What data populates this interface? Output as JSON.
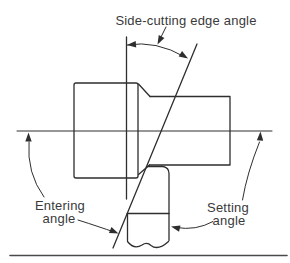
{
  "colors": {
    "ink": "#2e2e2e",
    "text": "#3a3a3a",
    "background": "#ffffff"
  },
  "diagram": {
    "labels": {
      "side_cutting_edge_angle": "Side-cutting edge angle",
      "entering_angle": {
        "line1": "Entering",
        "line2": "angle"
      },
      "setting_angle": {
        "line1": "Setting",
        "line2": "angle"
      }
    }
  }
}
